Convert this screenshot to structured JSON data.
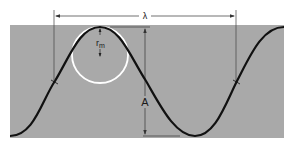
{
  "diagram": {
    "labels": {
      "wavelength": "λ",
      "amplitude": "A",
      "radius_symbol": "r",
      "radius_subscript": "m"
    },
    "colors": {
      "background": "#ffffff",
      "panel": "#a9a9a9",
      "wave": "#111111",
      "circle": "#ffffff",
      "dimension_lines": "#333333"
    }
  }
}
